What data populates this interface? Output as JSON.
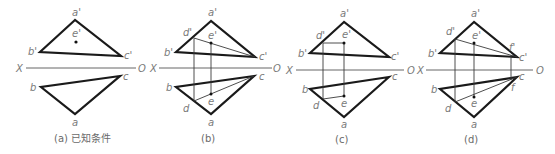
{
  "figure": {
    "panels": [
      {
        "id": "a",
        "caption": "(a) 已知条件",
        "axis": {
          "left": "X",
          "right": "O"
        },
        "front_view": {
          "a1": "a'",
          "b1": "b'",
          "c1": "c'",
          "e1": "e'"
        },
        "top_view": {
          "a": "a",
          "b": "b",
          "c": "c"
        }
      },
      {
        "id": "b",
        "caption": "(b)",
        "axis": {
          "left": "X",
          "right": "O"
        },
        "front_view": {
          "a1": "a'",
          "b1": "b'",
          "c1": "c'",
          "d1": "d'",
          "e1": "e'"
        },
        "top_view": {
          "a": "a",
          "b": "b",
          "c": "c",
          "d": "d",
          "e": "e"
        }
      },
      {
        "id": "c",
        "caption": "(c)",
        "axis": {
          "left": "X",
          "right": "O"
        },
        "front_view": {
          "a1": "a'",
          "b1": "b'",
          "c1": "c'",
          "d1": "d'",
          "e1": "e'"
        },
        "top_view": {
          "a": "a",
          "b": "b",
          "c": "c",
          "d": "d",
          "e": "e"
        }
      },
      {
        "id": "d",
        "caption": "(d)",
        "axis": {
          "left": "X",
          "right": "O"
        },
        "front_view": {
          "a1": "a'",
          "b1": "b'",
          "c1": "c'",
          "d1": "d'",
          "e1": "e'",
          "f1": "f'"
        },
        "top_view": {
          "a": "a",
          "b": "b",
          "c": "c",
          "d": "d",
          "e": "e",
          "f": "f"
        }
      }
    ]
  }
}
